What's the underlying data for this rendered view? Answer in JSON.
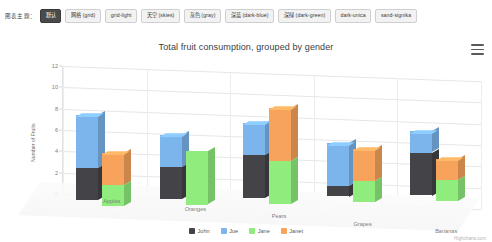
{
  "theme_bar": {
    "label": "图表主题：",
    "buttons": [
      {
        "label": "默认",
        "active": true
      },
      {
        "label": "网格 (grid)",
        "active": false
      },
      {
        "label": "grid-light",
        "active": false
      },
      {
        "label": "天空 (skies)",
        "active": false
      },
      {
        "label": "灰色 (gray)",
        "active": false
      },
      {
        "label": "深蓝 (dark-blue)",
        "active": false
      },
      {
        "label": "深绿 (dark-green)",
        "active": false
      },
      {
        "label": "dark-unica",
        "active": false
      },
      {
        "label": "sand-signika",
        "active": false
      }
    ]
  },
  "chart": {
    "menu_icon": "hamburger-menu-icon",
    "credits": "Highcharts.com"
  },
  "chart_data": {
    "type": "bar",
    "title": "Total fruit consumption, grouped by gender",
    "subtitle": "",
    "xlabel": "",
    "ylabel": "Number of Fruits",
    "categories": [
      "Apples",
      "Oranges",
      "Pears",
      "Grapes",
      "Bananas"
    ],
    "yticks": [
      "0",
      "2",
      "4",
      "6",
      "8",
      "10",
      "12"
    ],
    "ylim": [
      0,
      12
    ],
    "grid": true,
    "legend_position": "bottom",
    "stacking": "normal",
    "stack_groups": [
      "male",
      "female"
    ],
    "series": [
      {
        "name": "John",
        "stack": "male",
        "color": "#434348",
        "values": [
          3,
          3,
          4,
          1,
          4
        ]
      },
      {
        "name": "Joe",
        "stack": "male",
        "color": "#7cb5ec",
        "values": [
          5,
          3,
          3,
          4,
          2
        ]
      },
      {
        "name": "Jane",
        "stack": "female",
        "color": "#90ed7d",
        "values": [
          2,
          5,
          4,
          2,
          2
        ]
      },
      {
        "name": "Janet",
        "stack": "female",
        "color": "#f7a35c",
        "values": [
          3,
          0,
          5,
          3,
          2
        ]
      }
    ]
  }
}
